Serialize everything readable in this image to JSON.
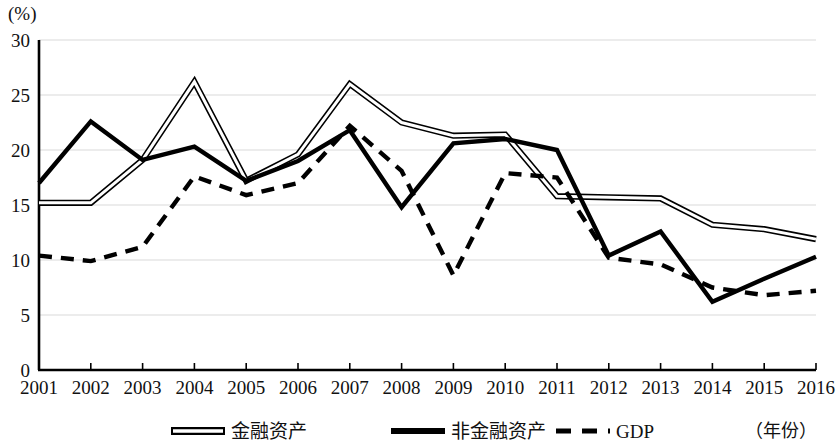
{
  "chart_data": {
    "type": "line",
    "title": "",
    "subtitle": "",
    "ylabel": "(%)",
    "xlabel": "（年份）",
    "ylim": [
      0,
      30
    ],
    "yticks": [
      0,
      5,
      10,
      15,
      20,
      25,
      30
    ],
    "ytick_labels": [
      "0",
      "5",
      "10",
      "15",
      "20",
      "25",
      "30"
    ],
    "grid": true,
    "grid_axis": "y",
    "legend_position": "bottom",
    "categories": [
      "2001",
      "2002",
      "2003",
      "2004",
      "2005",
      "2006",
      "2007",
      "2008",
      "2009",
      "2010",
      "2011",
      "2012",
      "2013",
      "2014",
      "2015",
      "2016"
    ],
    "x": [
      2001,
      2002,
      2003,
      2004,
      2005,
      2006,
      2007,
      2008,
      2009,
      2010,
      2011,
      2012,
      2013,
      2014,
      2015,
      2016
    ],
    "series": [
      {
        "name": "金融资产",
        "style": "double-line",
        "color": "#000000",
        "values": [
          15.2,
          15.2,
          19.1,
          26.2,
          17.2,
          19.6,
          26.0,
          22.5,
          21.3,
          21.4,
          15.8,
          15.7,
          15.6,
          13.2,
          12.8,
          11.9
        ]
      },
      {
        "name": "非金融资产",
        "style": "solid-thick",
        "color": "#000000",
        "values": [
          17.0,
          22.6,
          19.1,
          20.3,
          17.2,
          19.0,
          21.8,
          14.8,
          20.6,
          21.0,
          20.0,
          10.4,
          12.6,
          6.2,
          8.3,
          10.3
        ]
      },
      {
        "name": "GDP",
        "style": "dashed",
        "color": "#000000",
        "values": [
          10.4,
          9.9,
          11.2,
          17.6,
          15.9,
          17.0,
          22.2,
          18.1,
          8.6,
          17.9,
          17.5,
          10.2,
          9.6,
          7.5,
          6.8,
          7.2
        ]
      }
    ]
  },
  "legend": {
    "items": [
      {
        "label": "金融资产",
        "style": "double-line"
      },
      {
        "label": "非金融资产",
        "style": "solid-thick"
      },
      {
        "label": "GDP",
        "style": "dashed"
      }
    ]
  }
}
